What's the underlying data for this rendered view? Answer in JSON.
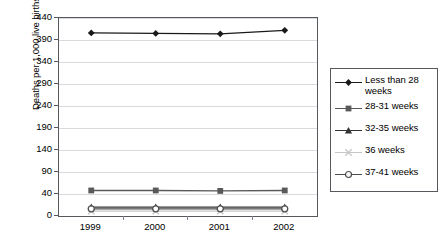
{
  "chart_data": {
    "type": "line",
    "title": "",
    "xlabel": "",
    "ylabel": "Deaths per 1,000 live births",
    "categories": [
      "1999",
      "2000",
      "2001",
      "2002"
    ],
    "x": [
      1999,
      2000,
      2001,
      2002
    ],
    "ylim": [
      0,
      440
    ],
    "yticks": [
      0,
      40,
      90,
      140,
      190,
      240,
      290,
      340,
      390,
      440
    ],
    "ytick_labels": [
      "0",
      "40",
      "90",
      "140",
      "190",
      "240",
      "290",
      "340",
      "390",
      "440"
    ],
    "grid": "horizontal",
    "legend_position": "right-outside",
    "series": [
      {
        "name": "Less than 28 weeks",
        "marker": "filled-diamond",
        "color": "#1a1a1a",
        "values": [
          406,
          405,
          404,
          412
        ]
      },
      {
        "name": "28-31 weeks",
        "marker": "filled-square",
        "color": "#595959",
        "values": [
          48,
          48,
          47,
          48
        ]
      },
      {
        "name": "32-35 weeks",
        "marker": "filled-triangle",
        "color": "#333333",
        "values": [
          16,
          16,
          16,
          16
        ]
      },
      {
        "name": "36 weeks",
        "marker": "light-cross",
        "color": "#c6c6c6",
        "values": [
          9,
          9,
          9,
          9
        ]
      },
      {
        "name": "37-41 weeks",
        "marker": "open-circle",
        "color": "#4d4d4d",
        "values": [
          13,
          13,
          13,
          13
        ]
      }
    ],
    "legend_entries": [
      {
        "label": "Less than 28 weeks",
        "marker": "filled-diamond",
        "color": "#1a1a1a"
      },
      {
        "label": "28-31 weeks",
        "marker": "filled-square",
        "color": "#595959"
      },
      {
        "label": "32-35 weeks",
        "marker": "filled-triangle",
        "color": "#333333"
      },
      {
        "label": "36 weeks",
        "marker": "light-cross",
        "color": "#c6c6c6"
      },
      {
        "label": "37-41 weeks",
        "marker": "open-circle",
        "color": "#4d4d4d"
      }
    ]
  },
  "axes": {
    "y_title": "Deaths per 1,000 live births"
  },
  "colors": {
    "frame": "#55585c",
    "grid": "#d9dadc",
    "background": "#ffffff"
  }
}
